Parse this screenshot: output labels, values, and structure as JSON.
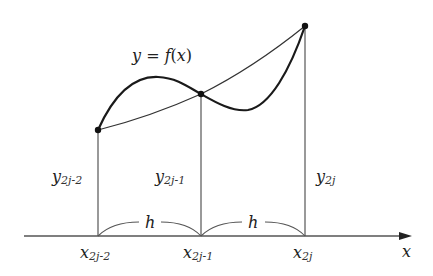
{
  "diagram": {
    "curve_label": {
      "y": "y",
      "eq": " = ",
      "f": "f",
      "lp": "(",
      "x": "x",
      "rp": ")"
    },
    "axis_label": "x",
    "spacing_label": "h",
    "x_labels": [
      {
        "base": "x",
        "sub": "2j-2"
      },
      {
        "base": "x",
        "sub": "2j-1"
      },
      {
        "base": "x",
        "sub": "2j"
      }
    ],
    "y_labels": [
      {
        "base": "y",
        "sub": "2j-2"
      },
      {
        "base": "y",
        "sub": "2j-1"
      },
      {
        "base": "y",
        "sub": "2j"
      }
    ],
    "colors": {
      "curve": "#1a1a1a",
      "line": "#555555",
      "background": "#ffffff"
    }
  }
}
